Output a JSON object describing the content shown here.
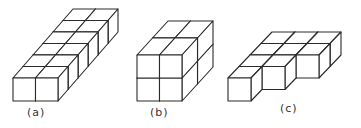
{
  "figures": [
    {
      "id": "a",
      "label": "(a)",
      "description": "2 wide x 6 deep x 1 tall block of cubes",
      "cols": 2,
      "depth": 6,
      "height": 1,
      "stagger": false
    },
    {
      "id": "b",
      "label": "(b)",
      "description": "2 wide x 2 deep x 2 tall block of cubes",
      "cols": 2,
      "depth": 2,
      "height": 2,
      "stagger": false
    },
    {
      "id": "c",
      "label": "(c)",
      "description": "3 wide x 4 deep staircase of cubes, front edge staggered",
      "cols": 3,
      "depth": 4,
      "height": 1,
      "stagger": true
    }
  ],
  "colors": {
    "line": "#2a2a2a",
    "background": "#ffffff"
  }
}
